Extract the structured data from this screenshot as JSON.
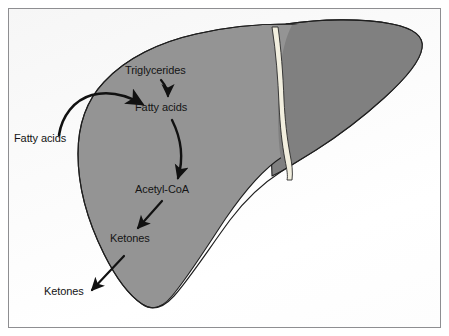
{
  "figure": {
    "organ": "liver",
    "frame_border_color": "#8e8e91",
    "background_color": "#fdfdfd"
  },
  "organ_shape": {
    "name": "liver",
    "right_lobe_color": "#808080",
    "left_lobe_color": "#949494",
    "outline_color": "#1f1f1f",
    "falciform_ligament_color": "#f2efdf",
    "falciform_ligament_label": "falciform-ligament"
  },
  "labels": {
    "triglycerides": "Triglycerides",
    "fatty_acids_inside": "Fatty acids",
    "fatty_acids_outside": "Fatty acids",
    "acetyl_coa": "Acetyl-CoA",
    "ketones_inside": "Ketones",
    "ketones_outside": "Ketones"
  },
  "arrows": [
    {
      "name": "arrow-fatty-acids-uptake",
      "from": "Fatty acids",
      "to": "Fatty acids",
      "style": "thick-curved",
      "color": "#111111"
    },
    {
      "name": "arrow-triglycerides-to-fatty-acids",
      "from": "Triglycerides",
      "to": "Fatty acids",
      "style": "short-curved",
      "color": "#111111"
    },
    {
      "name": "arrow-fatty-acids-to-acetyl-coa",
      "from": "Fatty acids",
      "to": "Acetyl-CoA",
      "style": "long-curved",
      "color": "#111111"
    },
    {
      "name": "arrow-acetyl-coa-to-ketones",
      "from": "Acetyl-CoA",
      "to": "Ketones",
      "style": "straight-diagonal",
      "color": "#111111"
    },
    {
      "name": "arrow-ketones-export",
      "from": "Ketones",
      "to": "Ketones",
      "style": "straight-diagonal",
      "color": "#111111"
    }
  ]
}
